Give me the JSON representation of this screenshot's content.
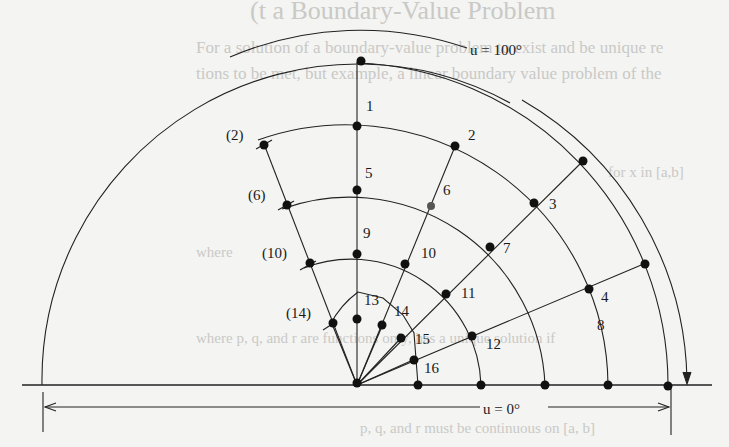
{
  "background_text": {
    "heading": "(t a Boundary-Value Problem",
    "line1": "For a solution of a boundary-value problem to exist and be unique re",
    "line2": "tions to be met, but example, a linear boundary value problem of the",
    "line3": "for x in [a,b]",
    "line4": "where",
    "line5": "where p, q, and r are functions only, has a unique solution if",
    "line6": "p, q, and r must be continuous on [a, b]"
  },
  "diagram": {
    "top_boundary_label": "u = 100°",
    "bottom_boundary_label": "u = 0°",
    "node_labels": {
      "n1": "1",
      "n2": "2",
      "n3": "3",
      "n4": "4",
      "n5": "5",
      "n6": "6",
      "n7": "7",
      "n8": "8",
      "n9": "9",
      "n10": "10",
      "n11": "11",
      "n12": "12",
      "n13": "13",
      "n14": "14",
      "n15": "15",
      "n16": "16",
      "m2": "(2)",
      "m6": "(6)",
      "m10": "(10)",
      "m14": "(14)"
    }
  }
}
